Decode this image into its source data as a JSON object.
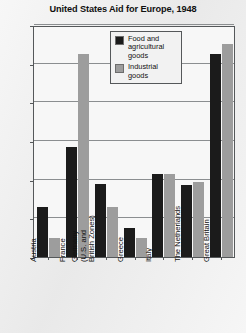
{
  "chart_data": {
    "type": "bar",
    "title": "United States Aid for Europe, 1948",
    "xlabel": "",
    "ylabel": "Millions of dollars",
    "ylim": [
      0,
      600
    ],
    "yticks": [
      0,
      100,
      200,
      300,
      400,
      500,
      600
    ],
    "ytick_labels": [
      "0",
      "100",
      "200",
      "300",
      "400",
      "500",
      "600"
    ],
    "grid": true,
    "legend_position": "upper-center",
    "categories": [
      "Austria",
      "France",
      "Germany\n(U.S. and\nBritish Zones)",
      "Greece",
      "Italy",
      "The Netherlands",
      "Great Britain"
    ],
    "series": [
      {
        "name": "Food and agricultural goods",
        "color": "#1b1b1b",
        "values": [
          130,
          285,
          190,
          75,
          215,
          185,
          525
        ]
      },
      {
        "name": "Industrial goods",
        "color": "#9d9d9d",
        "values": [
          50,
          525,
          130,
          50,
          215,
          195,
          550
        ]
      }
    ]
  },
  "legend": {
    "items": [
      {
        "label": "Food and agricultural goods",
        "color": "#1b1b1b"
      },
      {
        "label": "Industrial goods",
        "color": "#9d9d9d"
      }
    ]
  }
}
